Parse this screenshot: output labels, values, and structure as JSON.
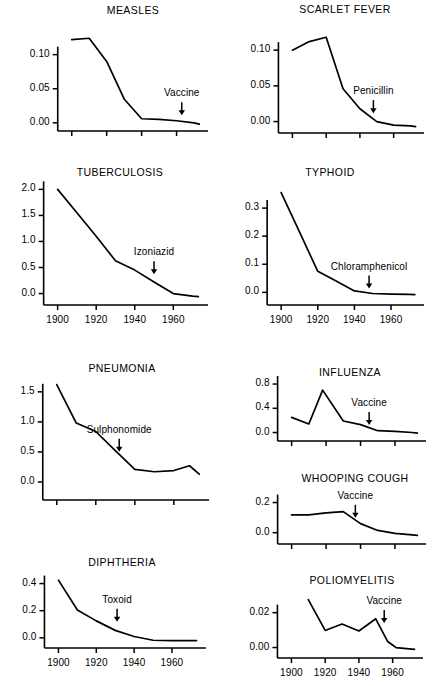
{
  "figure": {
    "line_color": "#000000",
    "background_color": "#ffffff"
  },
  "chart_data": [
    {
      "type": "line",
      "title": "MEASLES",
      "xlabel": "",
      "ylabel": "",
      "xlim": [
        1895,
        1978
      ],
      "ylim": [
        -0.012,
        0.142
      ],
      "yticks": [
        0.0,
        0.05,
        0.1
      ],
      "ytick_labels": [
        "0.00",
        "0.05",
        "0.10"
      ],
      "xticks": [
        1900,
        1920,
        1940,
        1960
      ],
      "xtick_labels": [],
      "grid": false,
      "legend": false,
      "x": [
        1900,
        1910,
        1920,
        1930,
        1940,
        1950,
        1960,
        1970,
        1973
      ],
      "values": [
        0.122,
        0.124,
        0.09,
        0.035,
        0.006,
        0.005,
        0.003,
        0.0,
        -0.002
      ],
      "annotations": [
        {
          "label": "Vaccine",
          "x": 1963,
          "y": 0.03,
          "arrow": true
        }
      ]
    },
    {
      "type": "line",
      "title": "SCARLET FEVER",
      "xlabel": "",
      "ylabel": "",
      "xlim": [
        1895,
        1978
      ],
      "ylim": [
        -0.016,
        0.138
      ],
      "yticks": [
        0.0,
        0.05,
        0.1
      ],
      "ytick_labels": [
        "0.00",
        "0.05",
        "0.10"
      ],
      "xticks": [
        1900,
        1920,
        1940,
        1960
      ],
      "xtick_labels": [],
      "grid": false,
      "legend": false,
      "x": [
        1900,
        1910,
        1920,
        1930,
        1940,
        1950,
        1960,
        1970,
        1973
      ],
      "values": [
        0.1,
        0.112,
        0.118,
        0.046,
        0.018,
        0.0,
        -0.005,
        -0.006,
        -0.007
      ],
      "annotations": [
        {
          "label": "Penicillin",
          "x": 1948,
          "y": 0.03,
          "arrow": true
        }
      ]
    },
    {
      "type": "line",
      "title": "TUBERCULOSIS",
      "xlabel": "",
      "ylabel": "",
      "xlim": [
        1895,
        1978
      ],
      "ylim": [
        -0.22,
        2.18
      ],
      "yticks": [
        0.0,
        0.5,
        1.0,
        1.5,
        2.0
      ],
      "ytick_labels": [
        "0.0",
        "0.5",
        "1.0",
        "1.5",
        "2.0"
      ],
      "xticks": [
        1900,
        1920,
        1940,
        1960
      ],
      "xtick_labels": [
        "1900",
        "1920",
        "1940",
        "1960"
      ],
      "grid": false,
      "legend": false,
      "x": [
        1900,
        1910,
        1920,
        1930,
        1940,
        1950,
        1960,
        1970,
        1973
      ],
      "values": [
        2.0,
        1.55,
        1.1,
        0.63,
        0.45,
        0.22,
        0.0,
        -0.05,
        -0.06
      ],
      "annotations": [
        {
          "label": "Izoniazid",
          "x": 1950,
          "y": 0.62,
          "arrow": true
        }
      ]
    },
    {
      "type": "line",
      "title": "TYPHOID",
      "xlabel": "",
      "ylabel": "",
      "xlim": [
        1895,
        1978
      ],
      "ylim": [
        -0.045,
        0.4
      ],
      "yticks": [
        0.0,
        0.1,
        0.2,
        0.3
      ],
      "ytick_labels": [
        "0.0",
        "0.1",
        "0.2",
        "0.3"
      ],
      "xticks": [
        1900,
        1920,
        1940,
        1960
      ],
      "xtick_labels": [
        "1900",
        "1920",
        "1940",
        "1960"
      ],
      "grid": false,
      "legend": false,
      "x": [
        1900,
        1910,
        1920,
        1930,
        1940,
        1950,
        1960,
        1970,
        1973
      ],
      "values": [
        0.355,
        0.215,
        0.075,
        0.04,
        0.005,
        -0.004,
        -0.006,
        -0.007,
        -0.008
      ],
      "annotations": [
        {
          "label": "Chloramphenicol",
          "x": 1948,
          "y": 0.06,
          "arrow": true
        }
      ]
    },
    {
      "type": "line",
      "title": "PNEUMONIA",
      "xlabel": "",
      "ylabel": "",
      "xlim": [
        1895,
        1978
      ],
      "ylim": [
        -0.3,
        1.78
      ],
      "yticks": [
        0.0,
        0.5,
        1.0,
        1.5
      ],
      "ytick_labels": [
        "0.0",
        "0.5",
        "1.0",
        "1.5"
      ],
      "xticks": [
        1900,
        1920,
        1940,
        1960
      ],
      "xtick_labels": [],
      "grid": false,
      "legend": false,
      "x": [
        1900,
        1910,
        1920,
        1930,
        1940,
        1950,
        1960,
        1968,
        1973
      ],
      "values": [
        1.62,
        0.98,
        0.84,
        0.52,
        0.21,
        0.17,
        0.19,
        0.27,
        0.13
      ],
      "annotations": [
        {
          "label": "Sulphonomide",
          "x": 1932,
          "y": 0.72,
          "arrow": true
        }
      ]
    },
    {
      "type": "line",
      "title": "INFLUENZA",
      "xlabel": "",
      "ylabel": "",
      "xlim": [
        1895,
        1978
      ],
      "ylim": [
        -0.14,
        0.9
      ],
      "yticks": [
        0.0,
        0.4,
        0.8
      ],
      "ytick_labels": [
        "0.0",
        "0.4",
        "0.8"
      ],
      "xticks": [
        1900,
        1920,
        1940,
        1960
      ],
      "xtick_labels": [],
      "grid": false,
      "legend": false,
      "x": [
        1900,
        1910,
        1918,
        1930,
        1940,
        1950,
        1960,
        1970,
        1973
      ],
      "values": [
        0.25,
        0.14,
        0.7,
        0.19,
        0.13,
        0.03,
        0.02,
        0.0,
        -0.01
      ],
      "annotations": [
        {
          "label": "Vaccine",
          "x": 1945,
          "y": 0.34,
          "arrow": true
        }
      ]
    },
    {
      "type": "line",
      "title": "WHOOPING COUGH",
      "xlabel": "",
      "ylabel": "",
      "xlim": [
        1895,
        1978
      ],
      "ylim": [
        -0.075,
        0.27
      ],
      "yticks": [
        0.0,
        0.2
      ],
      "ytick_labels": [
        "0.0",
        "0.2"
      ],
      "xticks": [
        1900,
        1920,
        1940,
        1960
      ],
      "xtick_labels": [],
      "grid": false,
      "legend": false,
      "x": [
        1900,
        1910,
        1920,
        1930,
        1940,
        1950,
        1960,
        1970,
        1973
      ],
      "values": [
        0.118,
        0.118,
        0.132,
        0.14,
        0.06,
        0.015,
        -0.005,
        -0.015,
        -0.018
      ],
      "annotations": [
        {
          "label": "Vaccine",
          "x": 1937,
          "y": 0.185,
          "arrow": true
        }
      ]
    },
    {
      "type": "line",
      "title": "DIPHTHERIA",
      "xlabel": "",
      "ylabel": "",
      "xlim": [
        1895,
        1978
      ],
      "ylim": [
        -0.075,
        0.5
      ],
      "yticks": [
        0.0,
        0.2,
        0.4
      ],
      "ytick_labels": [
        "0.0",
        "0.2",
        "0.4"
      ],
      "xticks": [
        1900,
        1920,
        1940,
        1960
      ],
      "xtick_labels": [
        "1900",
        "1920",
        "1940",
        "1960"
      ],
      "grid": false,
      "legend": false,
      "x": [
        1900,
        1910,
        1920,
        1930,
        1940,
        1950,
        1960,
        1970,
        1973
      ],
      "values": [
        0.425,
        0.205,
        0.125,
        0.055,
        0.01,
        -0.018,
        -0.02,
        -0.02,
        -0.021
      ],
      "annotations": [
        {
          "label": "Toxoid",
          "x": 1931,
          "y": 0.215,
          "arrow": true
        }
      ]
    },
    {
      "type": "line",
      "title": "POLIOMYELITIS",
      "xlabel": "",
      "ylabel": "",
      "xlim": [
        1895,
        1978
      ],
      "ylim": [
        -0.006,
        0.033
      ],
      "yticks": [
        0.0,
        0.02
      ],
      "ytick_labels": [
        "0.00",
        "0.02"
      ],
      "xticks": [
        1900,
        1920,
        1940,
        1960
      ],
      "xtick_labels": [
        "1900",
        "1920",
        "1940",
        "1960"
      ],
      "grid": false,
      "legend": false,
      "x": [
        1910,
        1920,
        1930,
        1940,
        1950,
        1957,
        1962,
        1973
      ],
      "values": [
        0.0275,
        0.0098,
        0.0135,
        0.0095,
        0.0165,
        0.0035,
        0.0,
        -0.001
      ],
      "annotations": [
        {
          "label": "Vaccine",
          "x": 1955,
          "y": 0.0215,
          "arrow": true
        }
      ]
    }
  ]
}
